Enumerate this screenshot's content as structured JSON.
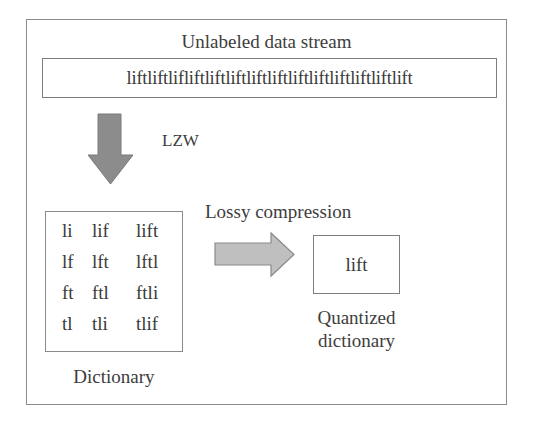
{
  "diagram": {
    "title": "Unlabeled data stream",
    "stream_text": "liftliftlifliftliftliftliftliftliftliftliftliftliftlift",
    "step1": {
      "label": "LZW",
      "arrow_direction": "down",
      "arrow_color": "#8a8a8a"
    },
    "dictionary": {
      "caption": "Dictionary",
      "entries": [
        [
          "li",
          "lif",
          "lift"
        ],
        [
          "lf",
          "lft",
          "lftl"
        ],
        [
          "ft",
          "ftl",
          "ftli"
        ],
        [
          "tl",
          "tli",
          "tlif"
        ]
      ]
    },
    "step2": {
      "label": "Lossy compression",
      "arrow_direction": "right",
      "arrow_color": "#bdbdbd"
    },
    "quantized_dictionary": {
      "entry": "lift",
      "caption_line1": "Quantized",
      "caption_line2": "dictionary"
    }
  },
  "colors": {
    "border": "#8a8a8a",
    "text": "#3a3a3a",
    "background": "#ffffff"
  }
}
